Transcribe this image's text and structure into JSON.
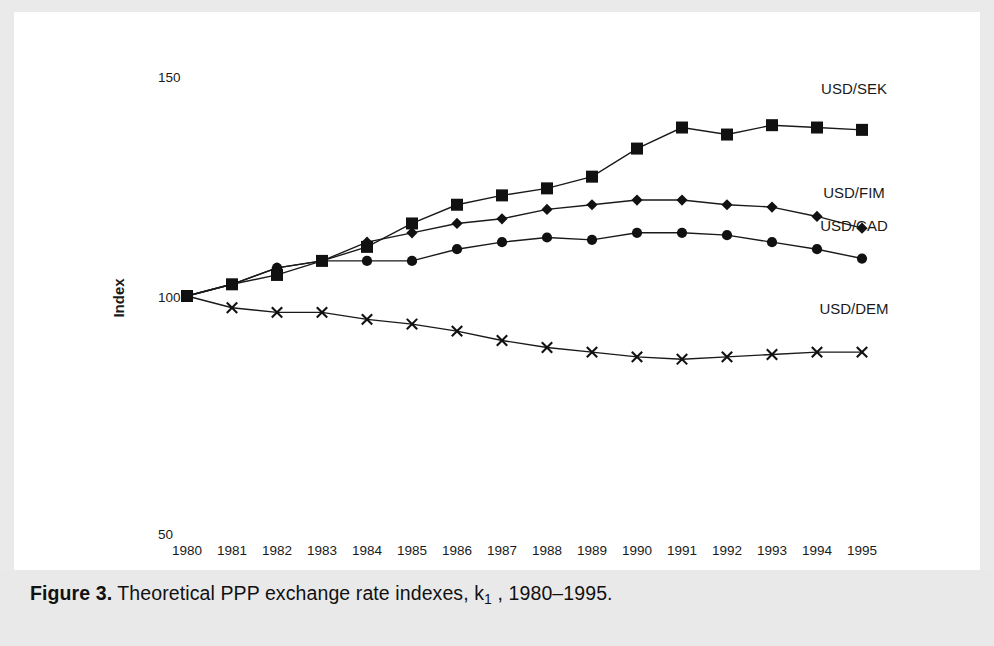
{
  "caption": {
    "figure_label": "Figure 3.",
    "text_before_k": " Theoretical PPP exchange rate indexes, k",
    "k_subscript": "1",
    "text_after_k": " , 1980–1995."
  },
  "axis": {
    "y_title": "Index",
    "y_top_label": "150",
    "y_mid_label": "100",
    "y_bottom_label": "50"
  },
  "series_labels": {
    "sek": "USD/SEK",
    "fim": "USD/FIM",
    "cad": "USD/CAD",
    "dem": "USD/DEM"
  },
  "chart_data": {
    "type": "line",
    "xlabel": "",
    "ylabel": "Index",
    "ylim": [
      50,
      150
    ],
    "xlim": [
      1980,
      1995
    ],
    "grid": false,
    "legend_position": "inline-right-of-series",
    "categories": [
      "1980",
      "1981",
      "1982",
      "1983",
      "1984",
      "1985",
      "1986",
      "1987",
      "1988",
      "1989",
      "1990",
      "1991",
      "1992",
      "1993",
      "1994",
      "1995"
    ],
    "x": [
      1980,
      1981,
      1982,
      1983,
      1984,
      1985,
      1986,
      1987,
      1988,
      1989,
      1990,
      1991,
      1992,
      1993,
      1994,
      1995
    ],
    "series": [
      {
        "name": "USD/SEK",
        "marker": "square",
        "values": [
          100,
          102.5,
          104.5,
          107.5,
          110.5,
          115.5,
          119.5,
          121.5,
          123,
          125.5,
          131.5,
          136,
          134.5,
          136.5,
          136,
          135.5
        ]
      },
      {
        "name": "USD/FIM",
        "marker": "diamond",
        "values": [
          100,
          102.5,
          106,
          107.5,
          111.5,
          113.5,
          115.5,
          116.5,
          118.5,
          119.5,
          120.5,
          120.5,
          119.5,
          119,
          117,
          114.5
        ]
      },
      {
        "name": "USD/CAD",
        "marker": "circle",
        "values": [
          100,
          102.5,
          106,
          107.5,
          107.5,
          107.5,
          110,
          111.5,
          112.5,
          112,
          113.5,
          113.5,
          113,
          111.5,
          110,
          108
        ]
      },
      {
        "name": "USD/DEM",
        "marker": "x",
        "values": [
          100,
          97.5,
          96.5,
          96.5,
          95,
          94,
          92.5,
          90.5,
          89,
          88,
          87,
          86.5,
          87,
          87.5,
          88,
          88
        ]
      }
    ]
  }
}
